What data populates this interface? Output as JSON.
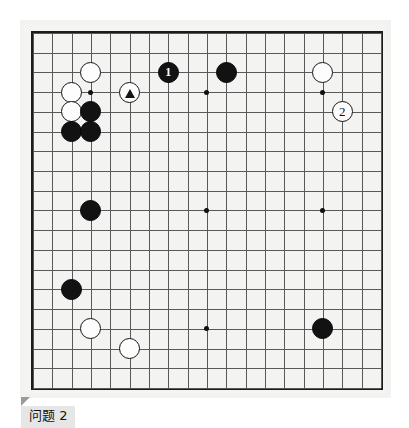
{
  "caption": {
    "text": "问题 2",
    "pointer_icon": "triangle-pointer-icon"
  },
  "board": {
    "size": 19,
    "name": "go-board",
    "colors": {
      "board_background": "#f3f3f1",
      "grid_line": "#58585a",
      "border": "#1b1b1b",
      "black_stone": "#121212",
      "white_stone": "#fdfdfd",
      "star_point": "#101010"
    },
    "geometry": {
      "origin_x": 9,
      "origin_y": 9,
      "step_x": 19.33,
      "step_y": 19.72
    },
    "star_points": [
      {
        "col": 3,
        "row": 3
      },
      {
        "col": 9,
        "row": 3
      },
      {
        "col": 15,
        "row": 3
      },
      {
        "col": 3,
        "row": 9
      },
      {
        "col": 9,
        "row": 9
      },
      {
        "col": 15,
        "row": 9
      },
      {
        "col": 3,
        "row": 15
      },
      {
        "col": 9,
        "row": 15
      },
      {
        "col": 15,
        "row": 15
      }
    ],
    "stones": [
      {
        "id": "w-c3r2",
        "color": "white",
        "col": 3,
        "row": 2,
        "label": "",
        "mark": ""
      },
      {
        "id": "w-c2r3",
        "color": "white",
        "col": 2,
        "row": 3,
        "label": "",
        "mark": ""
      },
      {
        "id": "w-c2r4",
        "color": "white",
        "col": 2,
        "row": 4,
        "label": "",
        "mark": ""
      },
      {
        "id": "b-c3r4",
        "color": "black",
        "col": 3,
        "row": 4,
        "label": "",
        "mark": ""
      },
      {
        "id": "b-c2r5",
        "color": "black",
        "col": 2,
        "row": 5,
        "label": "",
        "mark": ""
      },
      {
        "id": "b-c3r5",
        "color": "black",
        "col": 3,
        "row": 5,
        "label": "",
        "mark": ""
      },
      {
        "id": "w-c5r3-triangle",
        "color": "white",
        "col": 5,
        "row": 3,
        "label": "",
        "mark": "triangle"
      },
      {
        "id": "b-c7r2-move1",
        "color": "black",
        "col": 7,
        "row": 2,
        "label": "1",
        "mark": ""
      },
      {
        "id": "b-c10r2",
        "color": "black",
        "col": 10,
        "row": 2,
        "label": "",
        "mark": ""
      },
      {
        "id": "w-c15r2",
        "color": "white",
        "col": 15,
        "row": 2,
        "label": "",
        "mark": ""
      },
      {
        "id": "w-c16r4-move2",
        "color": "white",
        "col": 16,
        "row": 4,
        "label": "2",
        "mark": ""
      },
      {
        "id": "b-c3r9",
        "color": "black",
        "col": 3,
        "row": 9,
        "label": "",
        "mark": ""
      },
      {
        "id": "b-c2r13",
        "color": "black",
        "col": 2,
        "row": 13,
        "label": "",
        "mark": ""
      },
      {
        "id": "w-c3r15",
        "color": "white",
        "col": 3,
        "row": 15,
        "label": "",
        "mark": ""
      },
      {
        "id": "w-c5r16",
        "color": "white",
        "col": 5,
        "row": 16,
        "label": "",
        "mark": ""
      },
      {
        "id": "b-c15r15",
        "color": "black",
        "col": 15,
        "row": 15,
        "label": "",
        "mark": ""
      }
    ]
  }
}
